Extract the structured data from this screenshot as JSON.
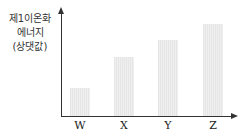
{
  "chart_data": {
    "type": "bar",
    "title": "",
    "xlabel": "",
    "ylabel": "제1이온화 에너지 (상댓값)",
    "ylabel_lines": [
      "제1이온화",
      "에너지",
      "(상댓값)"
    ],
    "categories": [
      "W",
      "X",
      "Y",
      "Z"
    ],
    "values": [
      28,
      59,
      76,
      92
    ],
    "value_note": "relative heights in pixels (no numeric scale shown)",
    "ylim": [
      0,
      105
    ],
    "grid": false,
    "legend": null,
    "bar_color": "#ebebeb",
    "axis_color": "#333333"
  }
}
